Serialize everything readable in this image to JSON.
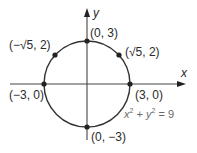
{
  "diagram": {
    "title": "",
    "equation": {
      "x_var": "x",
      "x_exp": "2",
      "plus": " + ",
      "y_var": "y",
      "y_exp": "2",
      "equals": " = 9"
    },
    "axes": {
      "x_label": "x",
      "y_label": "y"
    },
    "circle": {
      "center": [
        0,
        0
      ],
      "radius": 3,
      "stroke": "#333333"
    },
    "points": [
      {
        "label": "(0, 3)",
        "x": 0,
        "y": 3
      },
      {
        "label": "(√5, 2)",
        "x": 2.236,
        "y": 2
      },
      {
        "label": "(−√5, 2)",
        "x": -2.236,
        "y": 2
      },
      {
        "label": "(−3, 0)",
        "x": -3,
        "y": 0
      },
      {
        "label": "(3, 0)",
        "x": 3,
        "y": 0
      },
      {
        "label": "(0, −3)",
        "x": 0,
        "y": -3
      }
    ],
    "colors": {
      "line": "#333333",
      "point": "#222222",
      "text": "#2a2a2a",
      "equation_text": "#6a6a6a"
    }
  }
}
